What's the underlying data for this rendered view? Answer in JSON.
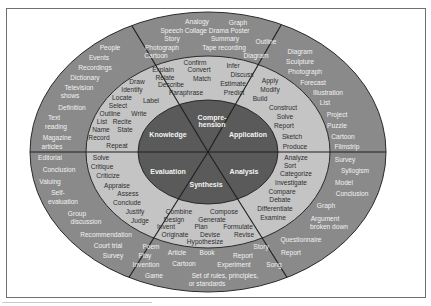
{
  "colors": {
    "outer_ring": "#8a8a8a",
    "middle_ring": "#c4c4c4",
    "core": "#5a5a5a",
    "lines": "#1e1e1e",
    "outer_text": "#f2f2f2",
    "middle_text": "#2e2e2e",
    "core_text": "#f4f4f4"
  },
  "core": {
    "knowledge": "Knowledge",
    "comprehension_1": "Compre-",
    "comprehension_2": "hension",
    "application": "Application",
    "analysis": "Analysis",
    "synthesis": "Synthesis",
    "evaluation": "Evaluation"
  },
  "verbs": {
    "knowledge": [
      "Draw",
      "Identify",
      "Locate",
      "Label",
      "Select",
      "Outline",
      "Write",
      "List",
      "Recite",
      "Name",
      "State",
      "Record",
      "Repeat"
    ],
    "comprehension": [
      "Confirm",
      "Infer",
      "Explain",
      "Convert",
      "Discuss",
      "Relate",
      "Match",
      "Describe",
      "Estimate",
      "Paraphrase",
      "Predict"
    ],
    "application": [
      "Apply",
      "Modify",
      "Build",
      "Construct",
      "Solve",
      "Report",
      "Sketch",
      "Produce"
    ],
    "analysis": [
      "Analyze",
      "Sort",
      "Categorize",
      "Investigate",
      "Compare",
      "Debate",
      "Differentiate",
      "Examine"
    ],
    "synthesis": [
      "Combine",
      "Compose",
      "Design",
      "Generate",
      "Invent",
      "Plan",
      "Formulate",
      "Originate",
      "Devise",
      "Revise",
      "Hypothesize"
    ],
    "evaluation": [
      "Solve",
      "Critique",
      "Criticize",
      "Appraise",
      "Assess",
      "Conclude",
      "Justify",
      "Judge"
    ]
  },
  "products": {
    "knowledge": [
      "People",
      "Events",
      "Recordings",
      "Dictionary",
      "Television",
      "shows",
      "Definition",
      "Text",
      "reading",
      "Magazine",
      "articles"
    ],
    "comprehension": [
      "Analogy",
      "Graph",
      "Speech Collage Drama Poster",
      "Story",
      "Summary",
      "Outline",
      "Photograph",
      "Tape recording",
      "Cartoon",
      "Diagram"
    ],
    "application": [
      "Diagram",
      "Sculpture",
      "Photograph",
      "Forecast",
      "Illustration",
      "List",
      "Project",
      "Puzzle",
      "Cartoon",
      "Filmstrip"
    ],
    "analysis": [
      "Survey",
      "Syllogism",
      "Model",
      "Conclusion",
      "Graph",
      "Argument",
      "broken down",
      "Questionnaire",
      "Report"
    ],
    "synthesis": [
      "Poem",
      "Story",
      "Play",
      "Article",
      "Book",
      "Report",
      "Invention",
      "Cartoon",
      "Experiment",
      "Song",
      "Game",
      "Set of rules, principles,",
      "or standards"
    ],
    "evaluation": [
      "Editorial",
      "Conclusion",
      "Valuing",
      "Self-",
      "evaluation",
      "Group",
      "discussion",
      "Recommendation",
      "Court trial",
      "Survey"
    ]
  }
}
